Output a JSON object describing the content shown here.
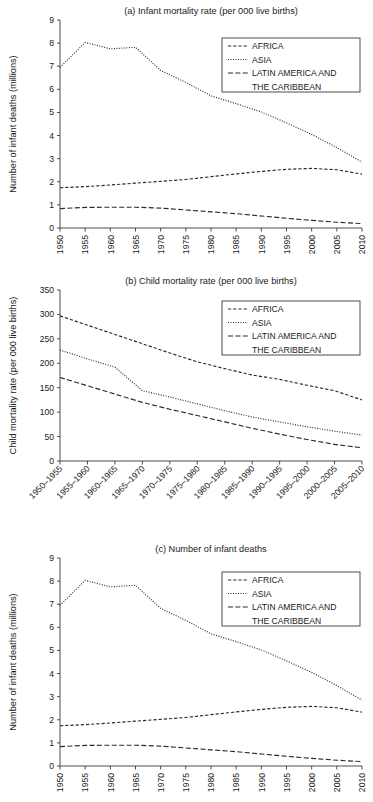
{
  "figure": {
    "background": "#ffffff",
    "ink": "#2b2b2b",
    "panels": [
      "a",
      "b",
      "c"
    ]
  },
  "legend": {
    "entries": [
      {
        "label": "AFRICA",
        "style": "dashed"
      },
      {
        "label": "ASIA",
        "style": "dotted"
      },
      {
        "label": "LATIN AMERICA AND",
        "style": "dashdot"
      },
      {
        "label": "THE CARIBBEAN",
        "style": "none"
      }
    ],
    "latin_line1": "LATIN AMERICA AND",
    "latin_line2": "THE CARIBBEAN"
  },
  "chart_data": [
    {
      "id": "a",
      "type": "line",
      "title": "(a) Infant mortality rate (per 000 live births)",
      "xlabel": "",
      "ylabel": "Number of infant deaths (millions)",
      "ylim": [
        0,
        9
      ],
      "yticks": [
        0,
        1,
        2,
        3,
        4,
        5,
        6,
        7,
        8,
        9
      ],
      "ytick_labels": [
        "0",
        "1",
        "2",
        "3",
        "4",
        "5",
        "6",
        "7",
        "8",
        "9"
      ],
      "grid": false,
      "legend_position": "upper right",
      "categories": [
        "1950",
        "1955",
        "1960",
        "1965",
        "1970",
        "1975",
        "1980",
        "1985",
        "1990",
        "1995",
        "2000",
        "2005",
        "2010"
      ],
      "series": [
        {
          "name": "AFRICA",
          "style": "dashed",
          "values": [
            1.74,
            1.79,
            1.86,
            1.94,
            2.02,
            2.1,
            2.22,
            2.34,
            2.45,
            2.54,
            2.58,
            2.52,
            2.33
          ]
        },
        {
          "name": "ASIA",
          "style": "dotted",
          "values": [
            6.95,
            8.03,
            7.75,
            7.82,
            6.82,
            6.3,
            5.72,
            5.38,
            5.02,
            4.55,
            4.05,
            3.48,
            2.85
          ]
        },
        {
          "name": "LATIN AMERICA AND THE CARIBBEAN",
          "style": "dashdot",
          "values": [
            0.84,
            0.89,
            0.9,
            0.9,
            0.86,
            0.78,
            0.7,
            0.62,
            0.52,
            0.42,
            0.33,
            0.25,
            0.19
          ]
        }
      ]
    },
    {
      "id": "b",
      "type": "line",
      "title": "(b) Child mortality rate (per 000 live births)",
      "xlabel": "",
      "ylabel": "Child mortality rate (per 000 live births)",
      "ylim": [
        0,
        350
      ],
      "yticks": [
        0,
        50,
        100,
        150,
        200,
        250,
        300,
        350
      ],
      "ytick_labels": [
        "0",
        "50",
        "100",
        "150",
        "200",
        "250",
        "300",
        "350"
      ],
      "grid": false,
      "legend_position": "upper right",
      "categories": [
        "1950–1955",
        "1955–1960",
        "1960–1965",
        "1965–1970",
        "1970–1975",
        "1975–1980",
        "1980–1985",
        "1985–1990",
        "1990–1995",
        "1995–2000",
        "2000–2005",
        "2005–2010"
      ],
      "series": [
        {
          "name": "AFRICA",
          "style": "dashed",
          "values": [
            297,
            278,
            259,
            240,
            221,
            203,
            189,
            176,
            167,
            155,
            144,
            125
          ]
        },
        {
          "name": "ASIA",
          "style": "dotted",
          "values": [
            227,
            209,
            192,
            144,
            131,
            117,
            103,
            90,
            80,
            70,
            61,
            53
          ]
        },
        {
          "name": "LATIN AMERICA AND THE CARIBBEAN",
          "style": "dashdot",
          "values": [
            171,
            154,
            137,
            120,
            106,
            93,
            80,
            67,
            55,
            44,
            34,
            27
          ]
        }
      ]
    },
    {
      "id": "c",
      "type": "line",
      "title": "(c) Number of infant deaths",
      "xlabel": "",
      "ylabel": "Number of infant deaths (millions)",
      "ylim": [
        0,
        9
      ],
      "yticks": [
        0,
        1,
        2,
        3,
        4,
        5,
        6,
        7,
        8,
        9
      ],
      "ytick_labels": [
        "0",
        "1",
        "2",
        "3",
        "4",
        "5",
        "6",
        "7",
        "8",
        "9"
      ],
      "grid": false,
      "legend_position": "upper right",
      "categories": [
        "1950",
        "1955",
        "1960",
        "1965",
        "1970",
        "1975",
        "1980",
        "1985",
        "1990",
        "1995",
        "2000",
        "2005",
        "2010"
      ],
      "series": [
        {
          "name": "AFRICA",
          "style": "dashed",
          "values": [
            1.74,
            1.79,
            1.86,
            1.94,
            2.02,
            2.1,
            2.22,
            2.34,
            2.45,
            2.54,
            2.58,
            2.52,
            2.33
          ]
        },
        {
          "name": "ASIA",
          "style": "dotted",
          "values": [
            6.95,
            8.03,
            7.75,
            7.82,
            6.82,
            6.3,
            5.72,
            5.38,
            5.02,
            4.55,
            4.05,
            3.48,
            2.85
          ]
        },
        {
          "name": "LATIN AMERICA AND THE CARIBBEAN",
          "style": "dashdot",
          "values": [
            0.84,
            0.89,
            0.9,
            0.9,
            0.86,
            0.78,
            0.7,
            0.62,
            0.52,
            0.42,
            0.33,
            0.25,
            0.19
          ]
        }
      ]
    }
  ]
}
